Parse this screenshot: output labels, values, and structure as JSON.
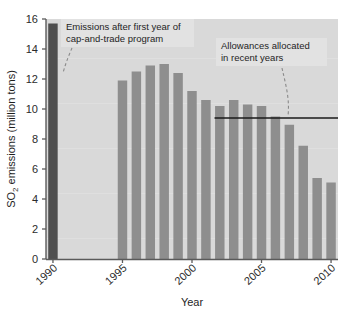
{
  "chart_data": {
    "type": "bar",
    "title": "",
    "subtitle": "",
    "xlabel": "Year",
    "ylabel": "SO2 emissions (million tons)",
    "ylabel_parts": {
      "lead": "SO",
      "subscript": "2",
      "tail": " emissions (million tons)"
    },
    "grid": false,
    "legend": "none",
    "ylim": [
      0,
      16
    ],
    "yticks": [
      0,
      2,
      4,
      6,
      8,
      10,
      12,
      14,
      16
    ],
    "ytick_labels": [
      "0",
      "2",
      "4",
      "6",
      "8",
      "10",
      "12",
      "14",
      "16"
    ],
    "xtick_labels": [
      "1990",
      "1995",
      "2000",
      "2005",
      "2010"
    ],
    "xtick_categories": [
      "1990",
      "1995",
      "2000",
      "2005",
      "2010"
    ],
    "categories": [
      "1990",
      "1991",
      "1992",
      "1993",
      "1994",
      "1995",
      "1996",
      "1997",
      "1998",
      "1999",
      "2000",
      "2001",
      "2002",
      "2003",
      "2004",
      "2005",
      "2006",
      "2007",
      "2008",
      "2009",
      "2010"
    ],
    "values": [
      15.7,
      null,
      null,
      null,
      null,
      11.9,
      12.5,
      12.9,
      13.0,
      12.4,
      11.2,
      10.6,
      10.2,
      10.6,
      10.3,
      10.2,
      9.5,
      8.95,
      7.55,
      5.4,
      5.1
    ],
    "bars": [
      {
        "year": "1990",
        "value": 15.7,
        "highlight": true
      },
      {
        "year": "1995",
        "value": 11.9,
        "highlight": false
      },
      {
        "year": "1996",
        "value": 12.5,
        "highlight": false
      },
      {
        "year": "1997",
        "value": 12.9,
        "highlight": false
      },
      {
        "year": "1998",
        "value": 13.0,
        "highlight": false
      },
      {
        "year": "1999",
        "value": 12.4,
        "highlight": false
      },
      {
        "year": "2000",
        "value": 11.2,
        "highlight": false
      },
      {
        "year": "2001",
        "value": 10.6,
        "highlight": false
      },
      {
        "year": "2002",
        "value": 10.2,
        "highlight": false
      },
      {
        "year": "2003",
        "value": 10.6,
        "highlight": false
      },
      {
        "year": "2004",
        "value": 10.3,
        "highlight": false
      },
      {
        "year": "2005",
        "value": 10.2,
        "highlight": false
      },
      {
        "year": "2006",
        "value": 9.5,
        "highlight": false
      },
      {
        "year": "2007",
        "value": 8.95,
        "highlight": false
      },
      {
        "year": "2008",
        "value": 7.55,
        "highlight": false
      },
      {
        "year": "2009",
        "value": 5.4,
        "highlight": false
      },
      {
        "year": "2010",
        "value": 5.1,
        "highlight": false
      }
    ],
    "reference_line": {
      "label": "Allowances allocated in recent years",
      "value": 9.4,
      "x_start_year": "2002",
      "x_end": "plot-right"
    },
    "annotations": [
      {
        "id": "cap-and-trade",
        "line1": "Emissions after first year of",
        "line2": "cap-and-trade program",
        "target": "1995 bar"
      },
      {
        "id": "allowances",
        "line1": "Allowances allocated",
        "line2": "in recent years",
        "target": "reference line"
      }
    ],
    "colors": {
      "bar": "#8e8e8e",
      "bar_highlight": "#4f4f4f",
      "plot_background": "#d9d9d9",
      "axis": "#5a5a5a",
      "reference_line": "#1a1a1a",
      "text": "#1e1e1e",
      "annotation_box": "#e2e2e2"
    }
  }
}
